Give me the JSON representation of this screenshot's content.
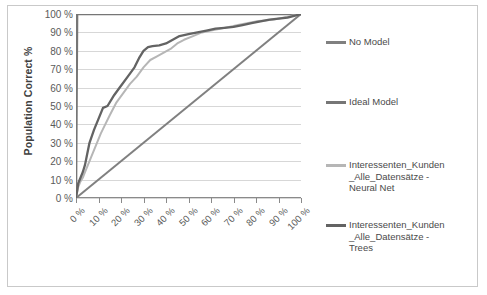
{
  "chart_data": {
    "type": "line",
    "title": "",
    "xlabel": "Overall Population %",
    "ylabel": "Population Correct %",
    "xlim": [
      0,
      100
    ],
    "ylim": [
      0,
      100
    ],
    "grid": "horizontal",
    "legend_position": "right",
    "x_tick_labels": [
      "0 %",
      "10 %",
      "20 %",
      "30 %",
      "40 %",
      "50 %",
      "60 %",
      "70 %",
      "80 %",
      "90 %",
      "100 %"
    ],
    "y_tick_labels": [
      "0 %",
      "10 %",
      "20 %",
      "30 %",
      "40 %",
      "50 %",
      "60 %",
      "70 %",
      "80 %",
      "90 %",
      "100 %"
    ],
    "x_ticks": [
      0,
      10,
      20,
      30,
      40,
      50,
      60,
      70,
      80,
      90,
      100
    ],
    "y_ticks": [
      0,
      10,
      20,
      30,
      40,
      50,
      60,
      70,
      80,
      90,
      100
    ],
    "series": [
      {
        "name": "No Model",
        "color": "#808080",
        "width": 2.0,
        "x": [
          0,
          100
        ],
        "values": [
          0,
          100
        ]
      },
      {
        "name": "Ideal Model",
        "color": "#767676",
        "width": 2.4,
        "x": [
          0,
          0.5,
          100
        ],
        "values": [
          0,
          100,
          100
        ]
      },
      {
        "name": "Interessenten_Kunden_Alle_Datensätze - Neural Net",
        "color": "#b6b6b6",
        "width": 2.0,
        "x": [
          0,
          1,
          2,
          3,
          4,
          5,
          7,
          9,
          11,
          13,
          15,
          18,
          21,
          24,
          27,
          30,
          33,
          36,
          39,
          42,
          45,
          48,
          52,
          56,
          60,
          64,
          68,
          72,
          76,
          80,
          84,
          88,
          92,
          96,
          100
        ],
        "values": [
          0,
          6,
          9,
          11,
          14,
          17,
          23,
          29,
          35,
          40,
          45,
          52,
          57,
          62,
          66,
          71,
          75,
          77,
          79,
          81,
          84,
          86,
          88,
          90,
          91,
          92,
          93,
          94,
          95,
          96,
          96.5,
          97,
          98,
          99,
          100
        ]
      },
      {
        "name": "Interessenten_Kunden_Alle_Datensätze - Trees",
        "color": "#636363",
        "width": 2.3,
        "x": [
          0,
          1,
          2,
          3,
          4,
          5,
          6,
          8,
          10,
          12,
          14,
          17,
          20,
          23,
          26,
          28,
          30,
          32,
          34,
          37,
          40,
          43,
          46,
          50,
          54,
          58,
          62,
          66,
          70,
          74,
          78,
          82,
          86,
          90,
          94,
          100
        ],
        "values": [
          0,
          8,
          11,
          14,
          18,
          24,
          30,
          37,
          43,
          49,
          50,
          56,
          61,
          66,
          71,
          76,
          80,
          82,
          82.5,
          83,
          84,
          86,
          88,
          89,
          90,
          91,
          92,
          92.5,
          93,
          94,
          95,
          96,
          97,
          97.5,
          98,
          100
        ]
      }
    ]
  },
  "legend": {
    "items": [
      {
        "label": "No Model",
        "color": "#808080"
      },
      {
        "label": "Ideal Model",
        "color": "#767676"
      },
      {
        "label": "Interessenten_Kunden\n_Alle_Datensätze -\nNeural Net",
        "color": "#b6b6b6"
      },
      {
        "label": "Interessenten_Kunden\n_Alle_Datensätze -\nTrees",
        "color": "#636363"
      }
    ]
  },
  "axes": {
    "y_title": "Population Correct %",
    "x_title": "Overall Population %"
  },
  "colors": {
    "frame": "#c9c9c9",
    "gridline": "#d7d7d7",
    "axis": "#8a8a8a",
    "tick_text": "#5a5a5a",
    "title_text": "#3f3f3f"
  }
}
